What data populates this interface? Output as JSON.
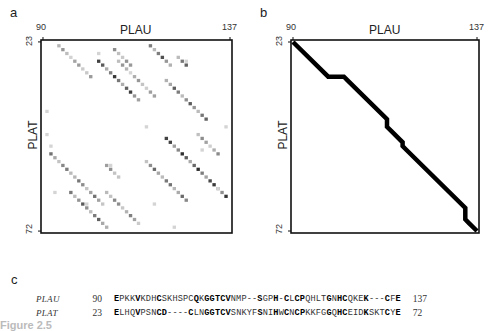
{
  "panels": {
    "a": {
      "label": "a",
      "x_title": "PLAU",
      "y_title": "PLAT",
      "x_ticks": [
        "90",
        "137"
      ],
      "y_ticks": [
        "23",
        "72"
      ]
    },
    "b": {
      "label": "b",
      "x_title": "PLAU",
      "y_title": "PLAT",
      "x_ticks": [
        "90",
        "137"
      ],
      "y_ticks": [
        "23",
        "72"
      ]
    },
    "c": {
      "label": "c"
    }
  },
  "alignment": {
    "rows": [
      {
        "name": "PLAU",
        "start": "90",
        "sequence": "EPKKVKDHCSKHSPCQKGGTCVNMP--SGPH-CLCPQHLTGNHCQKEK---CFE",
        "end": "137",
        "bold_positions": [
          0,
          4,
          8,
          15,
          17,
          18,
          19,
          20,
          21,
          27,
          30,
          32,
          34,
          35,
          40,
          42,
          43,
          47,
          51,
          53
        ]
      },
      {
        "name": "PLAT",
        "start": "23",
        "sequence": "ELHQVPSNCD----CLNGGTCVSNKYFSNIHWCNCPKKFGGQHCEIDKSKTCYE",
        "end": "72",
        "bold_positions": [
          0,
          4,
          8,
          9,
          14,
          17,
          18,
          19,
          20,
          21,
          27,
          30,
          32,
          34,
          35,
          40,
          42,
          43,
          47,
          51,
          53
        ]
      }
    ]
  },
  "caption_fragment": "Figure 2.5",
  "chart_data": [
    {
      "type": "heatmap",
      "title": "Dot plot of PLAU (90-137) vs PLAT (23-72)",
      "panel": "a",
      "xlabel": "PLAU",
      "ylabel": "PLAT",
      "x_range": [
        90,
        137
      ],
      "y_range": [
        23,
        72
      ],
      "x_tick_labels": [
        "90",
        "137"
      ],
      "y_tick_labels": [
        "23",
        "72"
      ],
      "description": "Grayscale dot matrix; darker cells indicate higher similarity score. Main diagonals follow the alignment path; numerous off-diagonal repeats (cysteine-rich motif).",
      "diagonals": [
        {
          "u0": 94,
          "t0": 24,
          "len": 9,
          "shade": 0.45
        },
        {
          "u0": 104,
          "t0": 28,
          "len": 11,
          "shade": 0.85
        },
        {
          "u0": 108,
          "t0": 25,
          "len": 5,
          "shade": 0.5
        },
        {
          "u0": 117,
          "t0": 24,
          "len": 6,
          "shade": 0.75
        },
        {
          "u0": 121,
          "t0": 33,
          "len": 11,
          "shade": 0.7
        },
        {
          "u0": 124,
          "t0": 27,
          "len": 3,
          "shade": 0.7
        },
        {
          "u0": 109,
          "t0": 28,
          "len": 10,
          "shade": 0.45
        },
        {
          "u0": 121,
          "t0": 48,
          "len": 16,
          "shade": 0.9
        },
        {
          "u0": 92,
          "t0": 52,
          "len": 14,
          "shade": 0.6
        },
        {
          "u0": 97,
          "t0": 62,
          "len": 10,
          "shade": 0.7
        },
        {
          "u0": 106,
          "t0": 62,
          "len": 9,
          "shade": 0.55
        },
        {
          "u0": 116,
          "t0": 54,
          "len": 11,
          "shade": 0.65
        },
        {
          "u0": 129,
          "t0": 47,
          "len": 6,
          "shade": 0.5
        },
        {
          "u0": 106,
          "t0": 55,
          "len": 4,
          "shade": 0.5
        }
      ]
    },
    {
      "type": "line",
      "title": "Optimal alignment path",
      "panel": "b",
      "xlabel": "PLAU",
      "ylabel": "PLAT",
      "x_range": [
        90,
        137
      ],
      "y_range": [
        23,
        72
      ],
      "x_tick_labels": [
        "90",
        "137"
      ],
      "y_tick_labels": [
        "23",
        "72"
      ],
      "path": [
        [
          90,
          23
        ],
        [
          99,
          32
        ],
        [
          103,
          32
        ],
        [
          104,
          33
        ],
        [
          114,
          43
        ],
        [
          114,
          45
        ],
        [
          115,
          46
        ],
        [
          118,
          49
        ],
        [
          118,
          50
        ],
        [
          119,
          51
        ],
        [
          134,
          66
        ],
        [
          134,
          69
        ],
        [
          135,
          70
        ],
        [
          137,
          72
        ]
      ]
    }
  ]
}
